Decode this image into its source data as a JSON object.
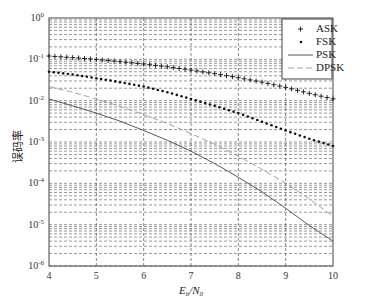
{
  "chart_data": {
    "type": "line",
    "title": "",
    "xlabel": "Eb/N0",
    "ylabel": "误码率",
    "xlim": [
      4,
      10
    ],
    "ylim": [
      1e-06,
      1
    ],
    "yscale": "log",
    "grid": true,
    "legend_position": "upper right",
    "x_ticks": [
      "4",
      "5",
      "6",
      "7",
      "8",
      "9",
      "10"
    ],
    "y_ticks": [
      "10^0",
      "10^-1",
      "10^-2",
      "10^-3",
      "10^-4",
      "10^-5",
      "10^-6"
    ],
    "x": [
      4,
      4.5,
      5,
      5.5,
      6,
      6.5,
      7,
      7.5,
      8,
      8.5,
      9,
      9.5,
      10
    ],
    "series": [
      {
        "name": "ASK",
        "marker": "+",
        "style": "markers",
        "values": [
          0.12,
          0.11,
          0.1,
          0.088,
          0.077,
          0.066,
          0.055,
          0.045,
          0.036,
          0.028,
          0.021,
          0.015,
          0.011
        ]
      },
      {
        "name": "FSK",
        "marker": ".",
        "style": "markers",
        "values": [
          0.05,
          0.043,
          0.035,
          0.028,
          0.022,
          0.016,
          0.011,
          0.0075,
          0.005,
          0.0031,
          0.0019,
          0.0012,
          0.0008
        ]
      },
      {
        "name": "PSK",
        "marker": "",
        "style": "solid",
        "values": [
          0.011,
          0.0075,
          0.005,
          0.0032,
          0.0019,
          0.0011,
          0.0006,
          0.0003,
          0.00014,
          6.2e-05,
          2.5e-05,
          9.5e-06,
          4e-06
        ]
      },
      {
        "name": "DPSK",
        "marker": "",
        "style": "dashed",
        "values": [
          0.022,
          0.016,
          0.011,
          0.0073,
          0.0046,
          0.0028,
          0.0016,
          0.00088,
          0.00045,
          0.00022,
          0.0001,
          4.2e-05,
          1.6e-05
        ]
      }
    ]
  },
  "labels": {
    "ylabel": "误码率",
    "xlabel_main": "E",
    "xlabel_sub1": "b",
    "xlabel_slash": "/N",
    "xlabel_sub2": "0"
  }
}
